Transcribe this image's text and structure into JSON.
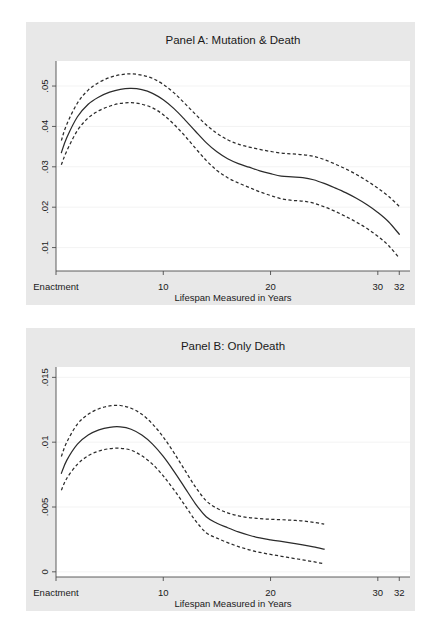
{
  "figure": {
    "width": 442,
    "height": 627,
    "background": "#ffffff",
    "panel_background": "#e8e8e8",
    "plot_background": "#ffffff",
    "line_color": "#2b2b2b",
    "grid_color": "#f2f2f2",
    "axis_color": "#4d4d4d"
  },
  "chart_data": [
    {
      "type": "line",
      "id": "panel-a",
      "title": "Panel A: Mutation & Death",
      "xlabel": "Lifespan Measured in Years",
      "ylabel": "",
      "xlim": [
        0,
        33
      ],
      "ylim": [
        0.0042,
        0.0562
      ],
      "grid": true,
      "legend": "none",
      "xticks": [
        0,
        10,
        20,
        30,
        32
      ],
      "xticklabels": [
        "Enactment",
        "10",
        "20",
        "30",
        "32"
      ],
      "yticks": [
        0.01,
        0.02,
        0.03,
        0.04,
        0.05
      ],
      "yticklabels": [
        ".01",
        ".02",
        ".03",
        ".04",
        ".05"
      ],
      "x": [
        0.5,
        1,
        2,
        3,
        4,
        5,
        6,
        7,
        8,
        9,
        10,
        11,
        12,
        13,
        14,
        15,
        16,
        17,
        18,
        19,
        20,
        21,
        22,
        23,
        24,
        25,
        26,
        27,
        28,
        29,
        30,
        31,
        32
      ],
      "series": [
        {
          "name": "point estimate",
          "style": "solid",
          "values": [
            0.0335,
            0.0372,
            0.0424,
            0.0455,
            0.0473,
            0.0485,
            0.0492,
            0.0494,
            0.0491,
            0.0482,
            0.0466,
            0.0444,
            0.0417,
            0.0388,
            0.036,
            0.0337,
            0.032,
            0.0308,
            0.0299,
            0.029,
            0.0283,
            0.0277,
            0.0275,
            0.0273,
            0.0268,
            0.0259,
            0.0248,
            0.0236,
            0.0222,
            0.0206,
            0.0187,
            0.0164,
            0.0133
          ]
        },
        {
          "name": "upper 95% CI",
          "style": "dashed",
          "values": [
            0.0365,
            0.0405,
            0.0458,
            0.049,
            0.0509,
            0.0521,
            0.0528,
            0.053,
            0.0527,
            0.0519,
            0.0504,
            0.0483,
            0.0457,
            0.043,
            0.0404,
            0.0383,
            0.0367,
            0.0356,
            0.0349,
            0.0343,
            0.0338,
            0.0334,
            0.0332,
            0.033,
            0.0326,
            0.0318,
            0.0307,
            0.0295,
            0.0281,
            0.0265,
            0.0247,
            0.0227,
            0.0202
          ]
        },
        {
          "name": "lower 95% CI",
          "style": "dashed",
          "values": [
            0.0305,
            0.0339,
            0.039,
            0.0421,
            0.0439,
            0.045,
            0.0457,
            0.0459,
            0.0455,
            0.0446,
            0.0429,
            0.0405,
            0.0377,
            0.0346,
            0.0316,
            0.0291,
            0.0273,
            0.026,
            0.0249,
            0.0238,
            0.0229,
            0.0221,
            0.0217,
            0.0215,
            0.021,
            0.0201,
            0.019,
            0.0177,
            0.0163,
            0.0147,
            0.0128,
            0.0105,
            0.0074
          ]
        }
      ]
    },
    {
      "type": "line",
      "id": "panel-b",
      "title": "Panel B: Only Death",
      "xlabel": "Lifespan Measured in Years",
      "ylabel": "",
      "xlim": [
        0,
        33
      ],
      "ylim": [
        -0.0004,
        0.0158
      ],
      "grid": true,
      "legend": "none",
      "xticks": [
        0,
        10,
        20,
        30,
        32
      ],
      "xticklabels": [
        "Enactment",
        "10",
        "20",
        "30",
        "32"
      ],
      "yticks": [
        0,
        0.005,
        0.01,
        0.015
      ],
      "yticklabels": [
        "0",
        ".005",
        ".01",
        ".015"
      ],
      "x": [
        0.5,
        1,
        2,
        3,
        4,
        5,
        6,
        7,
        8,
        9,
        10,
        11,
        12,
        13,
        14,
        15,
        16,
        17,
        18,
        19,
        20,
        21,
        22,
        23,
        24,
        25
      ],
      "series": [
        {
          "name": "point estimate",
          "style": "solid",
          "values": [
            0.0076,
            0.0086,
            0.00985,
            0.01055,
            0.01095,
            0.01115,
            0.01118,
            0.011,
            0.01055,
            0.00985,
            0.0089,
            0.00775,
            0.0065,
            0.00525,
            0.00425,
            0.00375,
            0.0034,
            0.00308,
            0.00282,
            0.00262,
            0.00247,
            0.00234,
            0.00221,
            0.00207,
            0.00192,
            0.00175
          ]
        },
        {
          "name": "upper 95% CI",
          "style": "dashed",
          "values": [
            0.0089,
            0.01,
            0.0114,
            0.01215,
            0.01258,
            0.0128,
            0.01283,
            0.01262,
            0.01215,
            0.0114,
            0.0104,
            0.00918,
            0.00785,
            0.00655,
            0.00548,
            0.0049,
            0.00455,
            0.00432,
            0.00418,
            0.0041,
            0.00405,
            0.00402,
            0.00398,
            0.00392,
            0.00382,
            0.00368
          ]
        },
        {
          "name": "lower 95% CI",
          "style": "dashed",
          "values": [
            0.0063,
            0.0072,
            0.0083,
            0.00895,
            0.00932,
            0.0095,
            0.00953,
            0.00938,
            0.00895,
            0.0083,
            0.0074,
            0.00632,
            0.00515,
            0.00395,
            0.00302,
            0.0026,
            0.00225,
            0.00195,
            0.0017,
            0.0015,
            0.00134,
            0.0012,
            0.00106,
            0.00092,
            0.00078,
            0.00062
          ]
        }
      ]
    }
  ]
}
